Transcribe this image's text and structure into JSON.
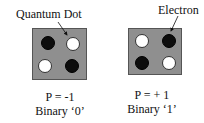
{
  "labels": {
    "quantum_dot": "Quantum Dot",
    "electron": "Electron"
  },
  "cells": [
    {
      "polarization": "P = -1",
      "binary": "Binary ‘0’",
      "dots": [
        "electron",
        "empty",
        "empty",
        "electron"
      ]
    },
    {
      "polarization": "P = + 1",
      "binary": "Binary ‘1’",
      "dots": [
        "empty",
        "electron",
        "electron",
        "empty"
      ]
    }
  ],
  "colors": {
    "cell_fill": "#8f8f8f",
    "electron": "#0d0d0d",
    "empty_dot": "#ffffff"
  }
}
